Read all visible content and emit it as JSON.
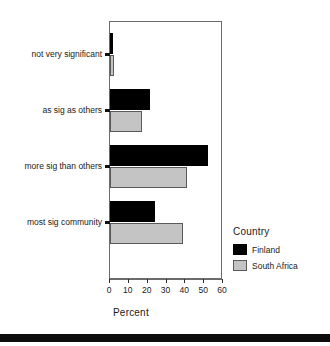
{
  "chart_data": {
    "type": "bar",
    "orientation": "horizontal",
    "title": "",
    "xlabel": "Percent",
    "ylabel": "",
    "xlim": [
      0,
      60
    ],
    "xticks": [
      0,
      10,
      20,
      30,
      40,
      50,
      60
    ],
    "grid": false,
    "legend_position": "right",
    "legend_title": "Country",
    "categories": [
      "not very significant",
      "as sig as others",
      "more sig than others",
      "most sig community"
    ],
    "series": [
      {
        "name": "Finland",
        "color": "#000000",
        "values": [
          1.5,
          21,
          52,
          24
        ]
      },
      {
        "name": "South Africa",
        "color": "#c4c4c4",
        "values": [
          2,
          17,
          41,
          39
        ]
      }
    ]
  },
  "axis": {
    "x_title": "Percent",
    "tick_labels": [
      "0",
      "10",
      "20",
      "30",
      "40",
      "50",
      "60"
    ]
  },
  "legend": {
    "title": "Country",
    "entries": [
      {
        "label": "Finland",
        "swatch": "black-swatch"
      },
      {
        "label": "South Africa",
        "swatch": "gray-swatch"
      }
    ]
  }
}
